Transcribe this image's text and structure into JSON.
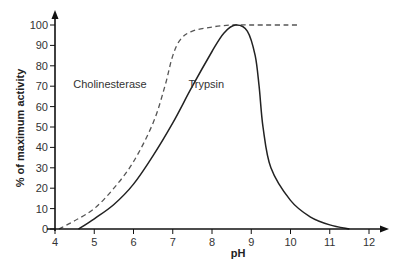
{
  "chart_data": {
    "type": "line",
    "title": "",
    "xlabel": "pH",
    "ylabel": "% of maximum activity",
    "xlim": [
      4,
      12
    ],
    "ylim": [
      0,
      100
    ],
    "x_ticks": [
      4,
      5,
      6,
      7,
      8,
      9,
      10,
      11,
      12
    ],
    "y_ticks": [
      0,
      10,
      20,
      30,
      40,
      50,
      60,
      70,
      80,
      90,
      100
    ],
    "grid": false,
    "legend": "inline labels",
    "series": [
      {
        "name": "Cholinesterase",
        "style": "dashed",
        "color": "#555555",
        "label_pos": {
          "x": 5.4,
          "y": 69
        },
        "points": [
          [
            4.1,
            0
          ],
          [
            4.5,
            4
          ],
          [
            5.0,
            10
          ],
          [
            5.5,
            20
          ],
          [
            6.0,
            33
          ],
          [
            6.5,
            52
          ],
          [
            6.8,
            70
          ],
          [
            7.0,
            85
          ],
          [
            7.2,
            93
          ],
          [
            7.5,
            97
          ],
          [
            8.0,
            99
          ],
          [
            8.5,
            100
          ],
          [
            9.0,
            100
          ],
          [
            10.2,
            100
          ]
        ]
      },
      {
        "name": "Trypsin",
        "style": "solid",
        "color": "#222222",
        "label_pos": {
          "x": 7.4,
          "y": 69
        },
        "points": [
          [
            4.6,
            0
          ],
          [
            5.0,
            5
          ],
          [
            5.5,
            12
          ],
          [
            6.0,
            22
          ],
          [
            6.5,
            36
          ],
          [
            7.0,
            52
          ],
          [
            7.5,
            70
          ],
          [
            8.0,
            87
          ],
          [
            8.3,
            96
          ],
          [
            8.6,
            100
          ],
          [
            8.9,
            97
          ],
          [
            9.1,
            85
          ],
          [
            9.2,
            70
          ],
          [
            9.3,
            50
          ],
          [
            9.5,
            30
          ],
          [
            10.0,
            14
          ],
          [
            10.5,
            6
          ],
          [
            11.0,
            2
          ],
          [
            11.5,
            0
          ]
        ]
      }
    ]
  },
  "colors": {
    "axis": "#111111",
    "text": "#333333"
  }
}
